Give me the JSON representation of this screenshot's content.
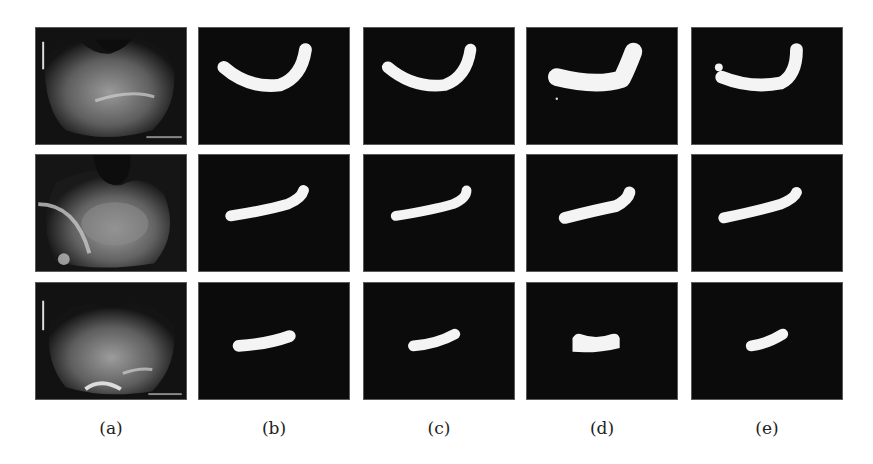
{
  "figure": {
    "columns": [
      {
        "id": "a",
        "label": "(a)",
        "content": "ultrasound-input"
      },
      {
        "id": "b",
        "label": "(b)",
        "content": "segmentation-mask"
      },
      {
        "id": "c",
        "label": "(c)",
        "content": "segmentation-mask"
      },
      {
        "id": "d",
        "label": "(d)",
        "content": "segmentation-mask"
      },
      {
        "id": "e",
        "label": "(e)",
        "content": "segmentation-mask"
      }
    ],
    "rows": 3,
    "colors": {
      "mask_background": "#0b0b0b",
      "mask_foreground": "#f4f4f4",
      "page_background": "#ffffff"
    }
  }
}
